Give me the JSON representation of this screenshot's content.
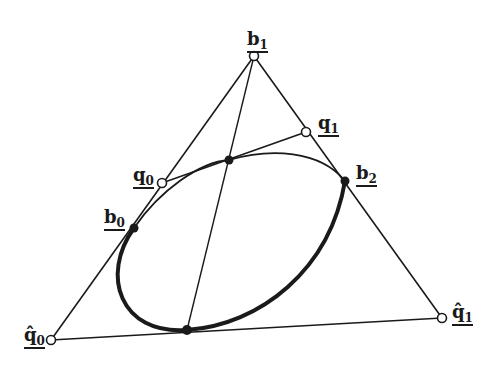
{
  "diagram": {
    "type": "conic-in-triangle",
    "colors": {
      "stroke": "#1a1a1a",
      "background": "#ffffff"
    },
    "points": {
      "b1": {
        "x": 254,
        "y": 56,
        "style": "open",
        "label": "b",
        "sub": "1",
        "hat": false
      },
      "q1": {
        "x": 306,
        "y": 132,
        "style": "open",
        "label": "q",
        "sub": "1",
        "hat": false
      },
      "q0": {
        "x": 162,
        "y": 183,
        "style": "open",
        "label": "q",
        "sub": "0",
        "hat": false
      },
      "b2": {
        "x": 345,
        "y": 181,
        "style": "filled",
        "label": "b",
        "sub": "2",
        "hat": false
      },
      "b0": {
        "x": 134,
        "y": 228,
        "style": "filled",
        "label": "b",
        "sub": "0",
        "hat": false
      },
      "q0hat": {
        "x": 51,
        "y": 340,
        "style": "open",
        "label": "q̂",
        "sub": "0",
        "hat": true
      },
      "q1hat": {
        "x": 442,
        "y": 318,
        "style": "open",
        "label": "q̂",
        "sub": "1",
        "hat": true
      },
      "center_top": {
        "x": 229,
        "y": 160,
        "style": "filled"
      },
      "bottom_tangent": {
        "x": 187,
        "y": 330,
        "style": "filled"
      }
    },
    "labels": {
      "b1": "b",
      "b1_sub": "1",
      "q1": "q",
      "q1_sub": "1",
      "q0": "q",
      "q0_sub": "0",
      "b2": "b",
      "b2_sub": "2",
      "b0": "b",
      "b0_sub": "0",
      "q0hat": "q̂",
      "q0hat_sub": "0",
      "q1hat": "q̂",
      "q1hat_sub": "1"
    }
  }
}
